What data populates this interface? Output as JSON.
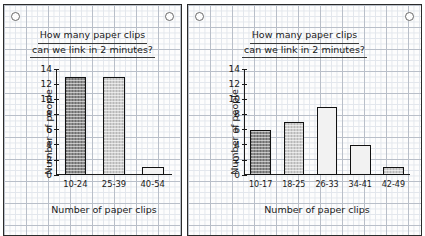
{
  "page": {
    "hole_punch_icon": "hole-punch-circle"
  },
  "charts": [
    {
      "title_line1": "How many paper clips",
      "title_line2": "can we link in 2 minutes?",
      "ylabel": "Number of people",
      "xlabel": "Number of paper clips"
    },
    {
      "title_line1": "How many paper clips",
      "title_line2": "can we link in 2 minutes?",
      "ylabel": "Number of people",
      "xlabel": "Number of paper clips"
    }
  ],
  "chart_data": [
    {
      "type": "bar",
      "title": "How many paper clips can we link in 2 minutes?",
      "xlabel": "Number of paper clips",
      "ylabel": "Number of people",
      "categories": [
        "10-24",
        "25-39",
        "40-54"
      ],
      "values": [
        13,
        13,
        1
      ],
      "yticks": [
        0,
        2,
        4,
        6,
        8,
        10,
        12,
        14
      ],
      "ylim": [
        0,
        14
      ],
      "grid": true,
      "legend": "none",
      "bar_fills": [
        "#8d8d8d",
        "#cfcfcf",
        "#f2f2f2"
      ]
    },
    {
      "type": "bar",
      "title": "How many paper clips can we link in 2 minutes?",
      "xlabel": "Number of paper clips",
      "ylabel": "Number of people",
      "categories": [
        "10-17",
        "18-25",
        "26-33",
        "34-41",
        "42-49"
      ],
      "values": [
        6,
        7,
        9,
        4,
        1
      ],
      "yticks": [
        0,
        2,
        4,
        6,
        8,
        10,
        12,
        14
      ],
      "ylim": [
        0,
        14
      ],
      "grid": true,
      "legend": "none",
      "bar_fills": [
        "#8d8d8d",
        "#cfcfcf",
        "#f2f2f2",
        "#f2f2f2",
        "#cfcfcf"
      ]
    }
  ]
}
